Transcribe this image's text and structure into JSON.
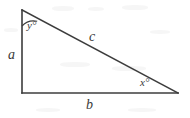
{
  "figure": {
    "name": "right-triangle-labeled",
    "background_color": "#ffffff",
    "stroke_color": "#3c3c3c",
    "label_color": "#3a3a3a",
    "stroke_width": 1.6,
    "vertices": {
      "top": {
        "x": 22,
        "y": 10
      },
      "bottom_left": {
        "x": 22,
        "y": 93
      },
      "bottom_right": {
        "x": 178,
        "y": 93
      }
    },
    "sides": [
      {
        "id": "a",
        "label": "a",
        "role": "vertical-leg",
        "from": "top",
        "to": "bottom_left"
      },
      {
        "id": "b",
        "label": "b",
        "role": "horizontal-leg",
        "from": "bottom_left",
        "to": "bottom_right"
      },
      {
        "id": "c",
        "label": "c",
        "role": "hypotenuse",
        "from": "top",
        "to": "bottom_right"
      }
    ],
    "angles": [
      {
        "id": "y",
        "label": "y°",
        "at": "top",
        "has_arc": true
      },
      {
        "id": "x",
        "label": "x°",
        "at": "bottom_right",
        "has_arc": false
      },
      {
        "id": "right",
        "label": "",
        "at": "bottom_left",
        "has_arc": false
      }
    ],
    "arc": {
      "path": "M 22 26 A 16 16 0 0 1 37.2 21.3"
    }
  }
}
